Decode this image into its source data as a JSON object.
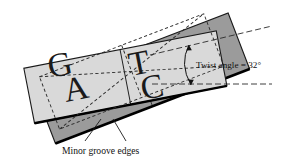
{
  "figure": {
    "type": "dna-base-pair-twist-diagram",
    "background_color": "#ffffff",
    "annotations": {
      "twist_label": "Twist angle = 32°",
      "twist_value": 32,
      "twist_unit": "degrees",
      "groove_caption": "Minor groove edges"
    },
    "base_letters": [
      {
        "letter": "G",
        "plane": "front",
        "position": "upper-left"
      },
      {
        "letter": "A",
        "plane": "front",
        "position": "lower-left"
      },
      {
        "letter": "T",
        "plane": "front",
        "position": "upper-right"
      },
      {
        "letter": "C",
        "plane": "front",
        "position": "lower-right"
      }
    ],
    "planes": [
      {
        "name": "back-plane",
        "fill": "#9b9b9b",
        "stroke": "#1a1a1a",
        "rotation_deg": -21
      },
      {
        "name": "front-plane",
        "fill": "#d9d9d9",
        "stroke": "#1a1a1a",
        "rotation_deg": -11
      }
    ],
    "colors": {
      "back_fill": "#9b9b9b",
      "front_fill": "#d9d9d9",
      "outline": "#1a1a1a",
      "minor_groove_edge": "#000000",
      "dashed": "#2a2a2a",
      "text": "#111111"
    }
  }
}
